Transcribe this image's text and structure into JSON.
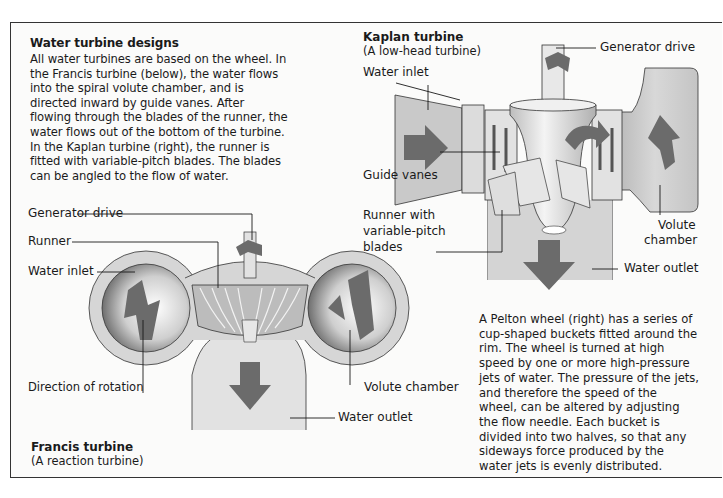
{
  "intro": {
    "title": "Water turbine designs",
    "lines": [
      "All water turbines are based on the wheel. In",
      "the Francis turbine (below), the water flows",
      "into the spiral volute chamber, and is",
      "directed inward by guide vanes. After",
      "flowing through the blades of the runner, the",
      "water flows out of the bottom of the turbine.",
      "In the Kaplan turbine (right), the runner is",
      "fitted with variable-pitch blades. The blades",
      "can be angled to the flow of water."
    ]
  },
  "kaplan": {
    "title": "Kaplan turbine",
    "subtitle": "(A low-head turbine)",
    "labels": {
      "generator_drive": "Generator drive",
      "water_inlet": "Water inlet",
      "guide_vanes": "Guide vanes",
      "runner_line1": "Runner with",
      "runner_line2": "variable-pitch",
      "runner_line3": "blades",
      "volute_line1": "Volute",
      "volute_line2": "chamber",
      "water_outlet": "Water outlet"
    }
  },
  "francis": {
    "title": "Francis turbine",
    "subtitle": "(A reaction turbine)",
    "labels": {
      "generator_drive": "Generator drive",
      "runner": "Runner",
      "water_inlet": "Water inlet",
      "direction_of_rotation": "Direction of rotation",
      "volute_chamber": "Volute chamber",
      "water_outlet": "Water outlet"
    }
  },
  "pelton": {
    "lines": [
      "A Pelton wheel (right) has a series of",
      "cup-shaped buckets fitted around the",
      "rim. The wheel is turned at high",
      "speed by one or more high-pressure",
      "jets of water. The pressure of the jets,",
      "and therefore the speed of the",
      "wheel, can be altered by adjusting",
      "the flow needle. Each bucket is",
      "divided into two halves, so that any",
      "sideways force produced by the",
      "water jets is evenly distributed."
    ]
  },
  "colors": {
    "arrow": "#6b6b6b",
    "body_fill": "#cfcfcf",
    "light_fill": "#e6e6e6",
    "line": "#222222"
  }
}
